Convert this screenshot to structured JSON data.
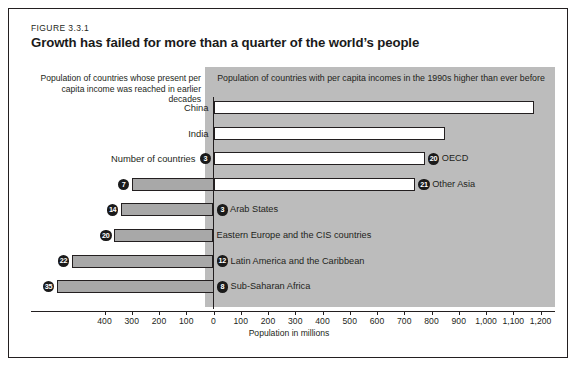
{
  "figure": {
    "number": "FIGURE 3.3.1",
    "title": "Growth has failed for more than a quarter of the world’s people"
  },
  "captions": {
    "left": "Population of countries whose present per capita income was reached in earlier decades",
    "right": "Population of countries with per capita incomes in the 1990s higher than ever before"
  },
  "axis": {
    "title": "Population in millions",
    "tick_labels": [
      "400",
      "300",
      "200",
      "100",
      "0",
      "100",
      "200",
      "300",
      "400",
      "500",
      "600",
      "700",
      "800",
      "900",
      "1,000",
      "1,100",
      "1,200"
    ],
    "tick_values": [
      -400,
      -300,
      -200,
      -100,
      0,
      100,
      200,
      300,
      400,
      500,
      600,
      700,
      800,
      900,
      1000,
      1100,
      1200
    ]
  },
  "legend_note": {
    "number_of_countries_label": "Number of countries"
  },
  "chart_data": {
    "type": "bar",
    "orientation": "horizontal",
    "title": "Growth has failed for more than a quarter of the world’s people",
    "xlabel": "Population in millions",
    "ylabel": "",
    "xlim": [
      -430,
      1230
    ],
    "grid": false,
    "legend": "none",
    "series": [
      {
        "name": "Population with incomes higher than ever before (right, millions)",
        "color": "#ffffff"
      },
      {
        "name": "Population whose present income was reached in earlier decades (left, millions)",
        "color": "#a8a8a8"
      }
    ],
    "rows": [
      {
        "label": "China",
        "label_side": "left",
        "positive": 1175,
        "negative": 0,
        "countries_positive": null,
        "countries_negative": null
      },
      {
        "label": "India",
        "label_side": "left",
        "positive": 850,
        "negative": 0,
        "countries_positive": null,
        "countries_negative": null
      },
      {
        "label": "OECD",
        "label_side": "right",
        "positive": 775,
        "negative": 0,
        "countries_positive": 20,
        "countries_negative": 3
      },
      {
        "label": "Other Asia",
        "label_side": "right",
        "positive": 740,
        "negative": 300,
        "countries_positive": 21,
        "countries_negative": 7
      },
      {
        "label": "Arab States",
        "label_side": "right",
        "positive": 0,
        "negative": 340,
        "countries_positive": 3,
        "countries_negative": 14
      },
      {
        "label": "Eastern Europe and the CIS countries",
        "label_side": "right",
        "positive": 0,
        "negative": 365,
        "countries_positive": null,
        "countries_negative": 20
      },
      {
        "label": "Latin America and the Caribbean",
        "label_side": "right",
        "positive": 0,
        "negative": 520,
        "countries_positive": 12,
        "countries_negative": 22
      },
      {
        "label": "Sub-Saharan Africa",
        "label_side": "right",
        "positive": 0,
        "negative": 575,
        "countries_positive": 8,
        "countries_negative": 35
      }
    ]
  }
}
